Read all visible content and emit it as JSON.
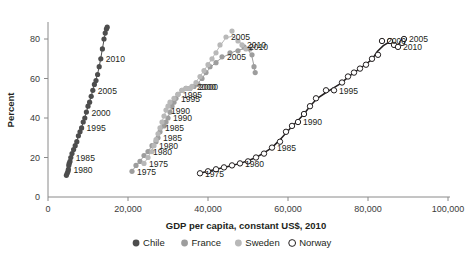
{
  "chart_data": {
    "type": "scatter",
    "title": "",
    "xlabel": "GDP per capita, constant US$, 2010",
    "ylabel": "Percent",
    "xlim": [
      0,
      100000
    ],
    "ylim": [
      0,
      92
    ],
    "xticks": [
      0,
      20000,
      40000,
      60000,
      80000,
      100000
    ],
    "xticklabels": [
      "0",
      "20,000",
      "40,000",
      "60,000",
      "80,000",
      "100,000"
    ],
    "yticks": [
      0,
      20,
      40,
      60,
      80
    ],
    "yticklabels": [
      "0",
      "20",
      "40",
      "60",
      "80"
    ],
    "grid": false,
    "legend_position": "bottom",
    "series": [
      {
        "name": "Chile",
        "color": "#4d4d4d",
        "marker": "filled-circle",
        "trendline": true,
        "points": [
          {
            "x": 4600,
            "y": 11
          },
          {
            "x": 4800,
            "y": 12
          },
          {
            "x": 5000,
            "y": 13
          },
          {
            "x": 5100,
            "y": 14,
            "label": "1980"
          },
          {
            "x": 5200,
            "y": 16
          },
          {
            "x": 5300,
            "y": 17
          },
          {
            "x": 5500,
            "y": 18
          },
          {
            "x": 5700,
            "y": 20,
            "label": "1985"
          },
          {
            "x": 6000,
            "y": 22
          },
          {
            "x": 6400,
            "y": 24
          },
          {
            "x": 6800,
            "y": 26
          },
          {
            "x": 7200,
            "y": 28
          },
          {
            "x": 7600,
            "y": 31
          },
          {
            "x": 8000,
            "y": 33
          },
          {
            "x": 8400,
            "y": 35,
            "label": "1995"
          },
          {
            "x": 8800,
            "y": 38
          },
          {
            "x": 9200,
            "y": 40
          },
          {
            "x": 9600,
            "y": 43,
            "label": "2000"
          },
          {
            "x": 10000,
            "y": 46
          },
          {
            "x": 10400,
            "y": 48
          },
          {
            "x": 10800,
            "y": 51
          },
          {
            "x": 11200,
            "y": 54,
            "label": "2005"
          },
          {
            "x": 11600,
            "y": 57
          },
          {
            "x": 12000,
            "y": 59
          },
          {
            "x": 12400,
            "y": 62
          },
          {
            "x": 12800,
            "y": 66
          },
          {
            "x": 13200,
            "y": 70,
            "label": "2010"
          },
          {
            "x": 13600,
            "y": 75
          },
          {
            "x": 14000,
            "y": 80
          },
          {
            "x": 14300,
            "y": 83
          },
          {
            "x": 14600,
            "y": 85
          },
          {
            "x": 14800,
            "y": 86
          }
        ]
      },
      {
        "name": "France",
        "color": "#9d9d9d",
        "marker": "filled-circle",
        "trendline": true,
        "points": [
          {
            "x": 21000,
            "y": 13,
            "label": "1975"
          },
          {
            "x": 22000,
            "y": 16
          },
          {
            "x": 23000,
            "y": 18
          },
          {
            "x": 24000,
            "y": 21
          },
          {
            "x": 25000,
            "y": 23,
            "label": "1980"
          },
          {
            "x": 26000,
            "y": 26
          },
          {
            "x": 27000,
            "y": 28
          },
          {
            "x": 27500,
            "y": 30,
            "label": "1985"
          },
          {
            "x": 28000,
            "y": 33
          },
          {
            "x": 29000,
            "y": 36
          },
          {
            "x": 29500,
            "y": 38
          },
          {
            "x": 30000,
            "y": 40,
            "label": "1990"
          },
          {
            "x": 30500,
            "y": 43
          },
          {
            "x": 31000,
            "y": 46
          },
          {
            "x": 31500,
            "y": 48
          },
          {
            "x": 32000,
            "y": 50,
            "label": "1995"
          },
          {
            "x": 32500,
            "y": 52
          },
          {
            "x": 33500,
            "y": 54
          },
          {
            "x": 34500,
            "y": 55
          },
          {
            "x": 35500,
            "y": 55
          },
          {
            "x": 36500,
            "y": 56,
            "label": "2000"
          },
          {
            "x": 37500,
            "y": 57
          },
          {
            "x": 38500,
            "y": 60
          },
          {
            "x": 39500,
            "y": 63
          },
          {
            "x": 40500,
            "y": 66
          },
          {
            "x": 42000,
            "y": 68
          },
          {
            "x": 43500,
            "y": 71,
            "label": "2005"
          },
          {
            "x": 45500,
            "y": 73
          },
          {
            "x": 47500,
            "y": 74
          },
          {
            "x": 49000,
            "y": 76,
            "label": "2010"
          },
          {
            "x": 50500,
            "y": 75
          },
          {
            "x": 51000,
            "y": 72
          },
          {
            "x": 51500,
            "y": 66
          },
          {
            "x": 51800,
            "y": 63
          }
        ]
      },
      {
        "name": "Sweden",
        "color": "#b8b8b8",
        "marker": "filled-circle",
        "trendline": true,
        "points": [
          {
            "x": 24000,
            "y": 17,
            "label": "1975"
          },
          {
            "x": 25000,
            "y": 20
          },
          {
            "x": 26000,
            "y": 23
          },
          {
            "x": 26500,
            "y": 26,
            "label": "1980"
          },
          {
            "x": 27000,
            "y": 29
          },
          {
            "x": 27500,
            "y": 32
          },
          {
            "x": 28000,
            "y": 35,
            "label": "1985"
          },
          {
            "x": 28500,
            "y": 38
          },
          {
            "x": 29000,
            "y": 41
          },
          {
            "x": 29500,
            "y": 44,
            "label": "1990"
          },
          {
            "x": 30000,
            "y": 46
          },
          {
            "x": 30500,
            "y": 48
          },
          {
            "x": 31500,
            "y": 50
          },
          {
            "x": 32500,
            "y": 52,
            "label": "1995"
          },
          {
            "x": 33500,
            "y": 54
          },
          {
            "x": 34500,
            "y": 55
          },
          {
            "x": 35500,
            "y": 55
          },
          {
            "x": 36000,
            "y": 56,
            "label": "2000"
          },
          {
            "x": 37000,
            "y": 58
          },
          {
            "x": 38000,
            "y": 61
          },
          {
            "x": 39000,
            "y": 64
          },
          {
            "x": 40000,
            "y": 67
          },
          {
            "x": 41000,
            "y": 70
          },
          {
            "x": 42000,
            "y": 73
          },
          {
            "x": 43000,
            "y": 77
          },
          {
            "x": 44500,
            "y": 81,
            "label": "2005"
          },
          {
            "x": 46000,
            "y": 84
          },
          {
            "x": 47500,
            "y": 79
          },
          {
            "x": 48500,
            "y": 77,
            "label": "2010"
          },
          {
            "x": 49500,
            "y": 75
          }
        ]
      },
      {
        "name": "Norway",
        "color": "#ffffff",
        "edge_color": "#231f20",
        "marker": "open-circle",
        "trendline": true,
        "points": [
          {
            "x": 38000,
            "y": 12,
            "label": "1975"
          },
          {
            "x": 40000,
            "y": 13
          },
          {
            "x": 42000,
            "y": 14
          },
          {
            "x": 44000,
            "y": 15
          },
          {
            "x": 46000,
            "y": 16
          },
          {
            "x": 48000,
            "y": 17,
            "label": "1980"
          },
          {
            "x": 50000,
            "y": 18
          },
          {
            "x": 52000,
            "y": 20
          },
          {
            "x": 54000,
            "y": 22
          },
          {
            "x": 56000,
            "y": 25,
            "label": "1985"
          },
          {
            "x": 58000,
            "y": 28
          },
          {
            "x": 59500,
            "y": 33
          },
          {
            "x": 61000,
            "y": 36
          },
          {
            "x": 62500,
            "y": 38,
            "label": "1990"
          },
          {
            "x": 64000,
            "y": 42
          },
          {
            "x": 65500,
            "y": 46
          },
          {
            "x": 67000,
            "y": 50
          },
          {
            "x": 69500,
            "y": 54
          },
          {
            "x": 71500,
            "y": 54,
            "label": "1995"
          },
          {
            "x": 73500,
            "y": 58
          },
          {
            "x": 75000,
            "y": 61
          },
          {
            "x": 76500,
            "y": 63
          },
          {
            "x": 78000,
            "y": 65
          },
          {
            "x": 79500,
            "y": 67
          },
          {
            "x": 81000,
            "y": 70
          },
          {
            "x": 82500,
            "y": 72
          },
          {
            "x": 83500,
            "y": 79,
            "label": "2000"
          },
          {
            "x": 85500,
            "y": 79
          },
          {
            "x": 86500,
            "y": 77
          },
          {
            "x": 87500,
            "y": 76,
            "label": "2010"
          },
          {
            "x": 88500,
            "y": 78
          },
          {
            "x": 89000,
            "y": 80,
            "label": "2005"
          }
        ]
      }
    ],
    "legend": [
      {
        "label": "Chile",
        "color": "#4d4d4d",
        "marker": "filled-circle"
      },
      {
        "label": "France",
        "color": "#9d9d9d",
        "marker": "filled-circle"
      },
      {
        "label": "Sweden",
        "color": "#b8b8b8",
        "marker": "filled-circle"
      },
      {
        "label": "Norway",
        "color": "#ffffff",
        "marker": "open-circle"
      }
    ]
  }
}
